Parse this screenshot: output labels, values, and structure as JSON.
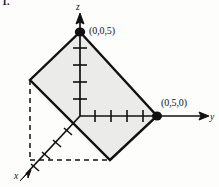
{
  "figure": {
    "problem_number": "1.",
    "background_color": "#fdfdfb",
    "stroke_color": "#111111",
    "fill_color": "#ebebe9",
    "axes": {
      "z": {
        "label": "z",
        "ticks": 4,
        "arrow": true
      },
      "y": {
        "label": "y",
        "ticks": 4,
        "arrow": true
      },
      "x": {
        "label": "x",
        "ticks": 4,
        "arrow": true
      }
    },
    "origin": {
      "x": 80,
      "y": 116
    },
    "points": [
      {
        "label": "(0,0,5)",
        "px": 80,
        "py": 32,
        "dot": true
      },
      {
        "label": "(0,5,0)",
        "px": 157,
        "py": 116,
        "dot": true
      }
    ],
    "plane_polygon": {
      "vertices": [
        {
          "px": 80,
          "py": 32
        },
        {
          "px": 157,
          "py": 116
        },
        {
          "px": 110,
          "py": 160
        },
        {
          "px": 30,
          "py": 80
        }
      ],
      "shaded": true
    },
    "dashed_lines": [
      {
        "x1": 30,
        "y1": 80,
        "x2": 30,
        "y2": 160
      },
      {
        "x1": 30,
        "y1": 160,
        "x2": 110,
        "y2": 160
      }
    ]
  }
}
